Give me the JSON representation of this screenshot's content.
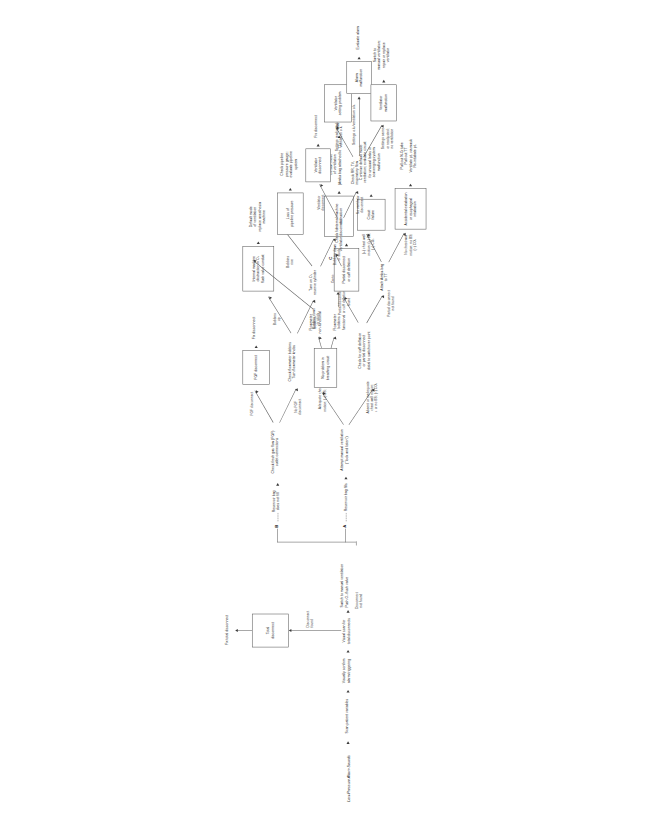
{
  "diagram": {
    "title": "Low-Pressure Alarm Sounds",
    "type": "clinical-decision-flowchart",
    "connectors": {
      "a": "A",
      "b": "B",
      "c": "C"
    },
    "steps": {
      "scan_patient": "Scan patient variables",
      "visually_confirm": "Visually confirm\nalarm triggering",
      "visual_scan": "Visual scan for\ntotal disconnects",
      "disconnect_found": "Disconnect\nfound",
      "total_disconnect_box": "Total\ndisconnect",
      "fix_total_disconnect": "Fix total disconnect",
      "disconnect_not_found": "Disconnect\nnot found",
      "switch_manual": "Switch to manual ventilation\nPush O₂ flush valve",
      "reservoir_fills": "Reservoir bag fills",
      "reservoir_not_fill": "Reservoir bag\ndoes not fill",
      "attempt_manual": "Attempt manual  ventilation\n(\"look and listen\")",
      "adequate_chest": "Adequate chest wall\nmotion; (+) BS; (+) CO₂",
      "no_problem_box": "No problem in\nbreathing circuit",
      "flowmeter_functional": "Flowmeter\nbobbins\nfunctional",
      "flowmeter_nonfunctional": "Flowmeter\nbobbins\nnon-functional",
      "go_to_vent_limb": "Go to\nventilator\nlimb",
      "absent_inadequate": "Absent or inadequate\nchest wall motion;\n↓ or no BS; (−) CO₂",
      "check_cuff": "Check for cuff deflation\nor partial disconnect\ndistal to switchover point",
      "partial_found": "Partial disconnect\nor cuff deflation\nfound",
      "partial_box": "Partial disconnect\nor cuff deflation",
      "fix_partial": "Fix partial\ndisconnect or\ncuff deflation",
      "partial_not_found": "Partial disconnect\nnot found",
      "attach_ambu": "Attach Ambu-bag\nto TT",
      "pos_chest": "(+) chest wall\nmotion; (+) BS;\n(+) CO₂",
      "circuit_failure_box": "Circuit\nfailure",
      "continue_default": "Continue default mode\nventilation; evaluate circuit\nfor unusual leaks or\nscavenging system\nmalfunction",
      "no_chest": "No chest wall\nmotion; no BS;\n(−) CO₂",
      "accidental_box": "Accidental extubation\nor esophageal intubation",
      "pull_out": "Pull out N-G tube\nPull out TT\nVentilate pt. via mask\nRe-intubate pt.",
      "check_fgf": "Check fresh gas flow (FGF)\noutlet connections",
      "fgf_disconnect_lbl": "FGF disconnect",
      "fgf_box": "FGF disconnect",
      "fix_disconnect": "Fix disconnect",
      "no_fgf_disconnect": "No FGF\ndisconnect",
      "check_bobbins": "Check flowmeter bobbins\nTurn flowmeter knobs",
      "bobbins_up": "Bobbins\nup",
      "internal_obstruction_o2_box": "Internal machine\nobstruction in O₂\nflush valve conduit",
      "default_replace": "Default mode\nof ventilation\nreplace anesthesia\nmachine",
      "bobbins_down_stuck_1": "Bobbins down\nor stuck",
      "turn_on_reserve": "Turn on O₂\nreserve cylinder",
      "bobbins_rise": "Bobbins\nrise",
      "loss_pipeline_box": "Loss of\npipeline pressure",
      "check_pipeline": "Check pipeline\npressure gauge;\nevaluate pipeline\nsystem",
      "bobbins_down_stuck_2": "Bobbins down\nor stuck",
      "internal_obstruction_box": "Internal machine\nobstruction",
      "default_ambu": "Default mode\nof ventilation\n(Ambu bag attached to TT)",
      "change_machine": "Change anesthesia machine",
      "check_vent_disconnect": "Check for\nventilator disconnect",
      "vent_disconnect_lbl": "Ventilator\ndisconnect",
      "vent_disconnect_box": "Ventilator\ndisconnect",
      "fix_disconnect_2": "Fix disconnect",
      "no_vent_disconnect": "No ventilator\ndisconnect",
      "check_rr_tv": "Check RR, TV,\ninspiratory flow",
      "settings_readjusted": "Settings readjusted;\nventilation o.k.",
      "vent_setting_box": "Ventilator\nsetting problem",
      "settings_ok": "Settings o.k./ventilation o.k.",
      "alarm_malfunction_box": "Alarm\nmalfunction",
      "evaluate_alarm": "Evaluate alarm",
      "settings_same": "Settings same\nor readjusted;\nno ventilation",
      "vent_malfunction_box": "Ventilator\nmalfunction",
      "switch_manual_repair": "Switch to\nmanual ventilation;\nrepair or replace\nventilator"
    }
  }
}
